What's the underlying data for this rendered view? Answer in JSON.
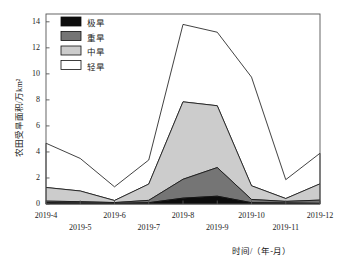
{
  "chart_data": {
    "type": "area",
    "stacked": true,
    "title": "",
    "xlabel": "时间/（年-月）",
    "ylabel": "农田受旱面积/万km²",
    "categories": [
      "2019-4",
      "2019-5",
      "2019-6",
      "2019-7",
      "2019-8",
      "2019-9",
      "2019-10",
      "2019-11",
      "2019-12"
    ],
    "xtick_labels": [
      "2019-4",
      "2019-5",
      "2019-6",
      "2019-7",
      "2019-8",
      "2019-9",
      "2019-10",
      "2019-11",
      "2019-12"
    ],
    "ytick_labels": [
      "0",
      "2",
      "4",
      "6",
      "8",
      "10",
      "12",
      "14"
    ],
    "yticks": [
      0,
      2,
      4,
      6,
      8,
      10,
      12,
      14
    ],
    "ylim": [
      0,
      14.6
    ],
    "xlim": [
      0,
      8
    ],
    "grid": false,
    "legend_position": "top-left",
    "series": [
      {
        "name": "极旱",
        "color": "#0d0d0d",
        "values": [
          0.1,
          0.08,
          0.05,
          0.1,
          0.45,
          0.6,
          0.1,
          0.08,
          0.05
        ]
      },
      {
        "name": "重旱",
        "color": "#757575",
        "values": [
          0.12,
          0.1,
          0.06,
          0.18,
          1.45,
          2.2,
          0.25,
          0.12,
          0.25
        ]
      },
      {
        "name": "中旱",
        "color": "#cccccc",
        "values": [
          1.05,
          0.82,
          0.16,
          1.25,
          5.95,
          4.75,
          1.05,
          0.22,
          1.25
        ]
      },
      {
        "name": "轻旱",
        "color": "#ffffff",
        "values": [
          3.4,
          2.5,
          1.05,
          1.85,
          5.95,
          5.65,
          8.35,
          1.45,
          2.35
        ]
      }
    ],
    "cumulative_tops": {
      "极旱": [
        0.1,
        0.08,
        0.05,
        0.1,
        0.45,
        0.6,
        0.1,
        0.08,
        0.05
      ],
      "重旱": [
        0.22,
        0.18,
        0.11,
        0.28,
        1.9,
        2.8,
        0.35,
        0.2,
        0.3
      ],
      "中旱": [
        1.27,
        1.0,
        0.27,
        1.53,
        7.85,
        7.55,
        1.4,
        0.42,
        1.55
      ],
      "轻旱": [
        4.67,
        3.5,
        1.32,
        3.38,
        13.8,
        13.2,
        9.75,
        1.87,
        3.9
      ]
    }
  },
  "legend": {
    "items": [
      {
        "label": "极旱",
        "color": "#0d0d0d"
      },
      {
        "label": "重旱",
        "color": "#757575"
      },
      {
        "label": "中旱",
        "color": "#cccccc"
      },
      {
        "label": "轻旱",
        "color": "#ffffff"
      }
    ]
  },
  "axis": {
    "y_title": "农田受旱面积/万km²",
    "x_title": "时间/（年-月）"
  }
}
